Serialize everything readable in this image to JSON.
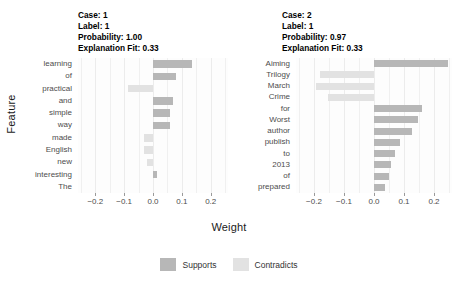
{
  "chart_data": {
    "type": "bar",
    "title": "",
    "xlabel": "Weight",
    "ylabel": "Feature",
    "xlim": [
      -0.26,
      0.26
    ],
    "xticks": [
      -0.2,
      -0.1,
      0.0,
      0.1,
      0.2
    ],
    "xticklabels": [
      "-0.2",
      "-0.1",
      "0.0",
      "0.1",
      "0.2"
    ],
    "grid": true,
    "orientation": "horizontal",
    "legend": {
      "position": "bottom",
      "entries": [
        {
          "label": "Supports",
          "color": "#b7b7b7"
        },
        {
          "label": "Contradicts",
          "color": "#e2e2e2"
        }
      ]
    },
    "facets": [
      {
        "name": "case-1",
        "header_lines": [
          "Case: 1",
          "Label: 1",
          "Probability: 1.00",
          "Explanation Fit: 0.33"
        ],
        "case": "1",
        "label": "1",
        "probability": "1.00",
        "explanation_fit": "0.33",
        "categories": [
          "learning",
          "of",
          "practical",
          "and",
          "simple",
          "way",
          "made",
          "English",
          "new",
          "interesting",
          "The"
        ],
        "values": [
          0.135,
          0.08,
          -0.085,
          0.068,
          0.06,
          0.06,
          -0.03,
          -0.032,
          -0.022,
          0.013,
          0.0
        ],
        "classes": [
          "Supports",
          "Supports",
          "Contradicts",
          "Supports",
          "Supports",
          "Supports",
          "Contradicts",
          "Contradicts",
          "Contradicts",
          "Supports",
          "Supports"
        ]
      },
      {
        "name": "case-2",
        "header_lines": [
          "Case: 2",
          "Label: 1",
          "Probability: 0.97",
          "Explanation Fit: 0.33"
        ],
        "case": "2",
        "label": "1",
        "probability": "0.97",
        "explanation_fit": "0.33",
        "categories": [
          "Aiming",
          "Trilogy",
          "March",
          "Crime",
          "for",
          "Worst",
          "author",
          "publish",
          "to",
          "2013",
          "of",
          "prepared"
        ],
        "values": [
          0.245,
          -0.18,
          -0.195,
          -0.155,
          0.16,
          0.145,
          0.125,
          0.085,
          0.07,
          0.055,
          0.05,
          0.035
        ],
        "classes": [
          "Supports",
          "Contradicts",
          "Contradicts",
          "Contradicts",
          "Supports",
          "Supports",
          "Supports",
          "Supports",
          "Supports",
          "Supports",
          "Supports",
          "Supports"
        ]
      }
    ]
  },
  "axes": {
    "x_title": "Weight",
    "y_title": "Feature"
  },
  "colors": {
    "supports": "#b7b7b7",
    "contradicts": "#e2e2e2",
    "panel_background": "#fdfdfd",
    "gridline": "#ececec"
  }
}
